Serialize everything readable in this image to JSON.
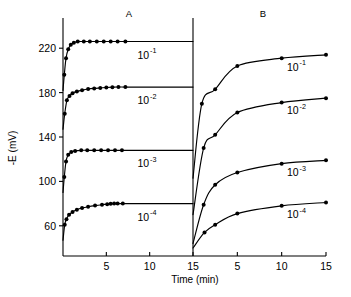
{
  "figure": {
    "panel_a_label": "A",
    "panel_b_label": "B",
    "x_axis_title": "Time (min)",
    "y_axis_title": "-E (mV)"
  },
  "chart_data": {
    "type": "line",
    "title": "",
    "xlabel": "Time (min)",
    "ylabel": "-E (mV)",
    "grid": false,
    "legend_position": "inline-right-of-curve",
    "panels": [
      {
        "name": "A",
        "xlim": [
          0,
          15
        ],
        "ylim": [
          40,
          240
        ],
        "xticks": [
          5,
          10,
          15
        ],
        "xticklabels": [
          "5",
          "10",
          "15"
        ],
        "yticks": [
          60,
          100,
          140,
          180,
          220
        ],
        "yticklabels": [
          "60",
          "100",
          "140",
          "180",
          "220"
        ],
        "series": [
          {
            "name": "10-1",
            "label": "10",
            "label_exponent": "-1",
            "plateau": 226,
            "x": [
              0.15,
              0.35,
              0.6,
              0.9,
              1.25,
              1.7,
              2.4,
              3.1,
              3.9,
              4.7,
              5.5,
              6.3,
              7.2
            ],
            "y": [
              196,
              211,
              219,
              223,
              225,
              226,
              226,
              226,
              226,
              226,
              226,
              226,
              226
            ]
          },
          {
            "name": "10-2",
            "label": "10",
            "label_exponent": "-2",
            "plateau": 185,
            "x": [
              0.2,
              0.45,
              0.75,
              1.1,
              1.6,
              2.2,
              2.9,
              3.6,
              4.3,
              5.0,
              5.7,
              6.4,
              7.2
            ],
            "y": [
              161,
              173,
              177,
              179.5,
              181,
              182.2,
              183.2,
              183.8,
              184.2,
              184.6,
              184.9,
              185,
              185
            ]
          },
          {
            "name": "10-3",
            "label": "10",
            "label_exponent": "-3",
            "plateau": 128,
            "x": [
              0.15,
              0.35,
              0.6,
              0.95,
              1.4,
              2.1,
              2.8,
              3.6,
              4.4,
              5.2,
              6.0,
              6.8
            ],
            "y": [
              104,
              118,
              124,
              126.5,
              127.5,
              128,
              128,
              128,
              128,
              128,
              128,
              128
            ]
          },
          {
            "name": "10-4",
            "label": "10",
            "label_exponent": "-4",
            "plateau": 80,
            "x": [
              0.2,
              0.4,
              0.7,
              1.1,
              1.6,
              2.2,
              2.9,
              3.7,
              4.5,
              5.1,
              5.5,
              5.9,
              6.3,
              6.9
            ],
            "y": [
              61,
              66,
              70,
              72.5,
              74.5,
              76,
              77.2,
              78.2,
              79,
              79.5,
              79.8,
              80,
              80,
              80
            ]
          }
        ]
      },
      {
        "name": "B",
        "xlim": [
          0,
          15
        ],
        "ylim": [
          40,
          240
        ],
        "xticks": [
          5,
          10,
          15
        ],
        "xticklabels": [
          "5",
          "10",
          "15"
        ],
        "series": [
          {
            "name": "10-1",
            "label": "10",
            "label_exponent": "-1",
            "x": [
              0,
              1.0,
              2.5,
              5.0,
              10.0,
              15.0
            ],
            "y": [
              103,
              170,
              183,
              204,
              211,
              214
            ]
          },
          {
            "name": "10-2",
            "label": "10",
            "label_exponent": "-2",
            "x": [
              0,
              1.2,
              2.5,
              5.0,
              10.0,
              15.0
            ],
            "y": [
              70,
              130,
              142,
              162,
              171,
              175
            ]
          },
          {
            "name": "10-3",
            "label": "10",
            "label_exponent": "-3",
            "x": [
              0,
              1.2,
              2.5,
              5.0,
              10.0,
              15.0
            ],
            "y": [
              44,
              79,
              97,
              108,
              116,
              119
            ]
          },
          {
            "name": "10-4",
            "label": "10",
            "label_exponent": "-4",
            "x": [
              0,
              1.3,
              2.5,
              5.0,
              10.0,
              15.0
            ],
            "y": [
              40,
              54,
              61,
              71,
              78,
              81
            ]
          }
        ]
      }
    ]
  }
}
